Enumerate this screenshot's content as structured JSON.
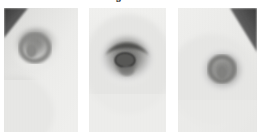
{
  "caption": {
    "text": "tion of colour values and region flux from areas",
    "note": "clipped caption line"
  },
  "figure": {
    "label": "three-panel-grayscale-figure",
    "background_color": "#ffffff",
    "panel_count": 3,
    "panels": [
      {
        "id": "panel-1",
        "name": "left-panel",
        "alt": "grayscale close-up of nipple and areola, oval dark ring offset upper-left, dark diagonal wedge in top-left corner",
        "base_color": "#ededeb",
        "ring_color": "#9a9a98",
        "core_color": "#8b8b89",
        "corner_wedge_color": "#4a4a4a",
        "center_x_pct": 45,
        "center_y_pct": 33,
        "ring_radius_x_pct": 30,
        "ring_radius_y_pct": 25
      },
      {
        "id": "panel-2",
        "name": "center-panel",
        "alt": "grayscale close-up of nipple and areola, near-circular dark ring centered, darker crescent along upper rim, dark oval nipple at centre",
        "base_color": "#eeeeec",
        "ring_color": "#8f8f8d",
        "core_color": "#6f6f6d",
        "crescent_color": "#555553",
        "center_x_pct": 50,
        "center_y_pct": 42,
        "ring_radius_x_pct": 34,
        "ring_radius_y_pct": 30
      },
      {
        "id": "panel-3",
        "name": "right-panel",
        "alt": "grayscale close-up of nipple and areola, dark ring offset to the right, small dark nipple, dark diagonal wedge in top-right corner",
        "base_color": "#ececea",
        "ring_color": "#979795",
        "core_color": "#858583",
        "corner_wedge_color": "#4f4f4f",
        "center_x_pct": 55,
        "center_y_pct": 50,
        "ring_radius_x_pct": 27,
        "ring_radius_y_pct": 24
      }
    ]
  }
}
